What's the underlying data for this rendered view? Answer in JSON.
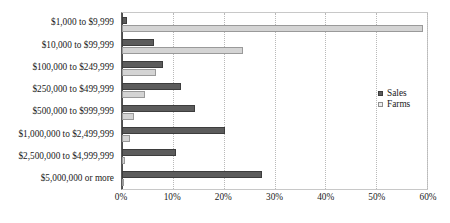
{
  "chart_data": {
    "type": "bar",
    "orientation": "horizontal",
    "title": "",
    "xlabel": "",
    "ylabel": "",
    "xlim": [
      0,
      60
    ],
    "xtick_labels": [
      "0%",
      "10%",
      "20%",
      "30%",
      "40%",
      "50%",
      "60%"
    ],
    "xtick_values": [
      0,
      10,
      20,
      30,
      40,
      50,
      60
    ],
    "grid": true,
    "grid_axis": "x",
    "legend_position": "right",
    "categories": [
      "$1,000 to $9,999",
      "$10,000 to $99,999",
      "$100,000 to $249,999",
      "$250,000 to $499,999",
      "$500,000 to $999,999",
      "$1,000,000 to $2,499,999",
      "$2,500,000 to $4,999,999",
      "$5,000,000 or more"
    ],
    "series": [
      {
        "name": "Sales",
        "color": "#5c5c5c",
        "values": [
          1.0,
          6.2,
          8.0,
          11.6,
          14.3,
          20.2,
          10.7,
          27.6
        ]
      },
      {
        "name": "Farms",
        "color": "#d4d4d4",
        "values": [
          59.3,
          23.8,
          6.7,
          4.6,
          2.4,
          1.6,
          0.6,
          0.3
        ]
      }
    ]
  },
  "legend": {
    "items": [
      {
        "label": "Sales",
        "swatch": "sales"
      },
      {
        "label": "Farms",
        "swatch": "farms"
      }
    ]
  }
}
